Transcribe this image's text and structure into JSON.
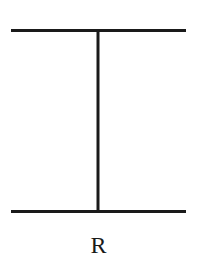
{
  "diagram": {
    "type": "line-figure",
    "stroke_color": "#1a1a1a",
    "background_color": "#ffffff",
    "elements": {
      "top_line": {
        "x1": 11,
        "y1": 30.5,
        "x2": 186,
        "y2": 30.5,
        "stroke_width": 3
      },
      "bottom_line": {
        "x1": 11,
        "y1": 211.5,
        "x2": 186,
        "y2": 211.5,
        "stroke_width": 3
      },
      "vertical_line": {
        "x1": 98,
        "y1": 30.5,
        "x2": 98,
        "y2": 211.5,
        "stroke_width": 3
      }
    },
    "label": "R"
  }
}
